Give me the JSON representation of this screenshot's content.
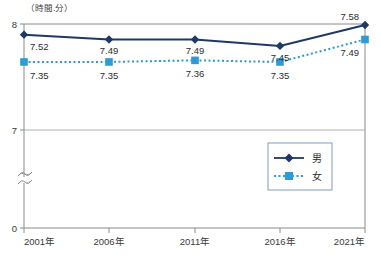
{
  "chart_data": {
    "type": "line",
    "title": "",
    "subtitle": "",
    "unit_label": "（時間.分）",
    "xlabel": "",
    "ylabel": "",
    "categories": [
      "2001年",
      "2006年",
      "2011年",
      "2016年",
      "2021年"
    ],
    "ylim": [
      0,
      8
    ],
    "y_ticks": [
      "8",
      "7",
      "0"
    ],
    "y_axis_break": true,
    "grid": true,
    "legend_position": "inside-right-middle",
    "series": [
      {
        "name": "男",
        "key": "male",
        "color": "#1f3864",
        "marker": "diamond",
        "linestyle": "solid",
        "values": [
          7.52,
          7.49,
          7.49,
          7.45,
          7.58
        ],
        "labels": [
          "7.52",
          "7.49",
          "7.49",
          "7.45",
          "7.58"
        ]
      },
      {
        "name": "女",
        "key": "female",
        "color": "#2e9bd6",
        "marker": "square",
        "linestyle": "dotted",
        "values": [
          7.35,
          7.35,
          7.36,
          7.35,
          7.49
        ],
        "labels": [
          "7.35",
          "7.35",
          "7.36",
          "7.35",
          "7.49"
        ]
      }
    ]
  },
  "legend": {
    "items": [
      {
        "label": "男"
      },
      {
        "label": "女"
      }
    ]
  },
  "colors": {
    "male": "#1f3864",
    "female": "#2e9bd6",
    "axis": "#8a8a8a",
    "text": "#2b2b2b"
  }
}
